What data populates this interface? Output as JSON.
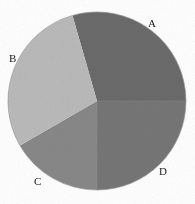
{
  "chart_data": {
    "type": "pie",
    "title": "",
    "xlabel": "",
    "ylabel": "",
    "categories": [
      "A",
      "B",
      "C",
      "D"
    ],
    "values": [
      29.4,
      26.7,
      16.7,
      25.0
    ],
    "units": "percent",
    "labels": [
      "A",
      "B",
      "C",
      "D"
    ],
    "start_angle_deg": -106,
    "direction": "clockwise",
    "legend": "none",
    "grid": false,
    "slice_colors": [
      "#6b6b6b",
      "#bababa",
      "#888888",
      "#767676"
    ],
    "outline_color": "#9a9a9a",
    "background": "#ffffff",
    "label_color": "#1a1a1a",
    "geometry": {
      "center_x": 97,
      "center_y": 101,
      "radius": 89
    },
    "slices": [
      {
        "label": "A",
        "value": 29.4,
        "color": "#6b6b6b",
        "start_deg": -106,
        "end_deg": 0
      },
      {
        "label": "D",
        "value": 25.0,
        "color": "#767676",
        "start_deg": 0,
        "end_deg": 90
      },
      {
        "label": "C",
        "value": 16.7,
        "color": "#888888",
        "start_deg": 90,
        "end_deg": 150
      },
      {
        "label": "B",
        "value": 26.7,
        "color": "#bababa",
        "start_deg": 150,
        "end_deg": 254
      }
    ],
    "label_positions": [
      {
        "label": "A",
        "x": 152,
        "y": 24
      },
      {
        "label": "B",
        "x": 13,
        "y": 59
      },
      {
        "label": "C",
        "x": 38,
        "y": 182
      },
      {
        "label": "D",
        "x": 163,
        "y": 172
      }
    ]
  }
}
